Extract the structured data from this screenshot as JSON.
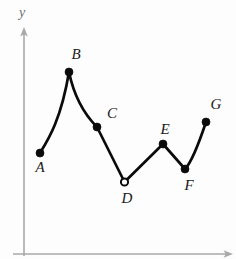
{
  "figure": {
    "background_color": "#fdfdfd",
    "curve_color": "#0b0b0b",
    "axis_color": "#a9a9a9",
    "label_color": "#1a1a1a"
  },
  "axes": {
    "y_axis_label": "y",
    "x_axis_label": "",
    "x_tick_labels": [],
    "y_tick_labels": [],
    "grid": "off",
    "y_axis_has_arrow": true,
    "x_axis_has_arrow": true
  },
  "chart_data": {
    "type": "line",
    "title": "",
    "subtitle": "",
    "xlabel": "",
    "ylabel": "y",
    "xlim": [
      0,
      236
    ],
    "ylim": [
      0,
      259
    ],
    "grid": "off",
    "legend": "none",
    "points": [
      {
        "label": "A",
        "x": 40,
        "y": 153,
        "marker": "filled",
        "label_x": 40,
        "label_y": 172,
        "label_pos": "below"
      },
      {
        "label": "B",
        "x": 69,
        "y": 72,
        "marker": "filled",
        "label_x": 76,
        "label_y": 59,
        "label_pos": "above-right"
      },
      {
        "label": "C",
        "x": 97,
        "y": 127,
        "marker": "filled",
        "label_x": 112,
        "label_y": 118,
        "label_pos": "above-right"
      },
      {
        "label": "D",
        "x": 124.5,
        "y": 182,
        "marker": "open",
        "label_x": 127,
        "label_y": 203,
        "label_pos": "below"
      },
      {
        "label": "E",
        "x": 163,
        "y": 144,
        "marker": "filled",
        "label_x": 165,
        "label_y": 134,
        "label_pos": "above"
      },
      {
        "label": "F",
        "x": 185,
        "y": 169,
        "marker": "filled",
        "label_x": 189,
        "label_y": 190,
        "label_pos": "below"
      },
      {
        "label": "G",
        "x": 206,
        "y": 122,
        "marker": "filled",
        "label_x": 216,
        "label_y": 109,
        "label_pos": "above-right"
      }
    ],
    "curve_path": "M 40 153 C 48 140, 61 120, 69 72 C 74 96, 85 115, 97 127 L 124.5 182 L 163 144 L 185 169 C 192 162, 200 140, 206 122",
    "series": [
      {
        "name": "f(x)",
        "x": [
          40,
          69,
          97,
          124.5,
          163,
          185,
          206
        ],
        "values": [
          153,
          72,
          127,
          182,
          144,
          169,
          122
        ]
      }
    ]
  },
  "geometry": {
    "y_axis": {
      "x": 24,
      "y_top": 30,
      "y_bottom": 256
    },
    "x_axis": {
      "y": 254,
      "x_left": 13,
      "x_right": 230
    },
    "y_axis_label_x": 22,
    "y_axis_label_y": 17,
    "marker_radius_filled": 4.0,
    "marker_radius_open": 3.6
  }
}
